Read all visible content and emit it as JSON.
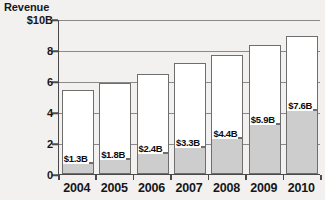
{
  "chart_data": {
    "type": "bar",
    "stacked": true,
    "title": "",
    "subtitle": "",
    "xlabel": "",
    "ylabel": "Revenue",
    "ylim": [
      0,
      10
    ],
    "ytick_labels": [
      "$10B",
      "8",
      "6",
      "4",
      "2",
      "0"
    ],
    "ytick_values": [
      10,
      8,
      6,
      4,
      2,
      0
    ],
    "grid": true,
    "legend": "none",
    "categories": [
      "2004",
      "2005",
      "2006",
      "2007",
      "2008",
      "2009",
      "2010"
    ],
    "series": [
      {
        "name": "lower-segment",
        "color": "#cdcdcd",
        "values": [
          0.7,
          0.95,
          1.35,
          1.75,
          2.35,
          3.25,
          4.15
        ]
      },
      {
        "name": "upper-segment",
        "color": "#ffffff",
        "values": [
          4.75,
          4.95,
          5.1,
          5.4,
          5.35,
          5.1,
          4.75
        ]
      }
    ],
    "totals": [
      5.45,
      5.9,
      6.45,
      7.15,
      7.7,
      8.35,
      8.9
    ],
    "annotations": [
      {
        "category": "2004",
        "label": "$1.3B",
        "value": 1.3
      },
      {
        "category": "2005",
        "label": "$1.8B",
        "value": 1.8
      },
      {
        "category": "2006",
        "label": "$2.4B",
        "value": 2.4
      },
      {
        "category": "2007",
        "label": "$3.3B",
        "value": 3.3
      },
      {
        "category": "2008",
        "label": "$4.4B",
        "value": 4.4
      },
      {
        "category": "2009",
        "label": "$5.9B",
        "value": 5.9
      },
      {
        "category": "2010",
        "label": "$7.6B",
        "value": 7.6
      }
    ]
  },
  "colors": {
    "background": "#f2f1ef",
    "axis": "#4a4a4a",
    "grid": "#8a8a8a",
    "bar_outline": "#6e6e6e",
    "bar_lower_fill": "#cdcdcd",
    "bar_upper_fill": "#ffffff",
    "text": "#17171a"
  }
}
